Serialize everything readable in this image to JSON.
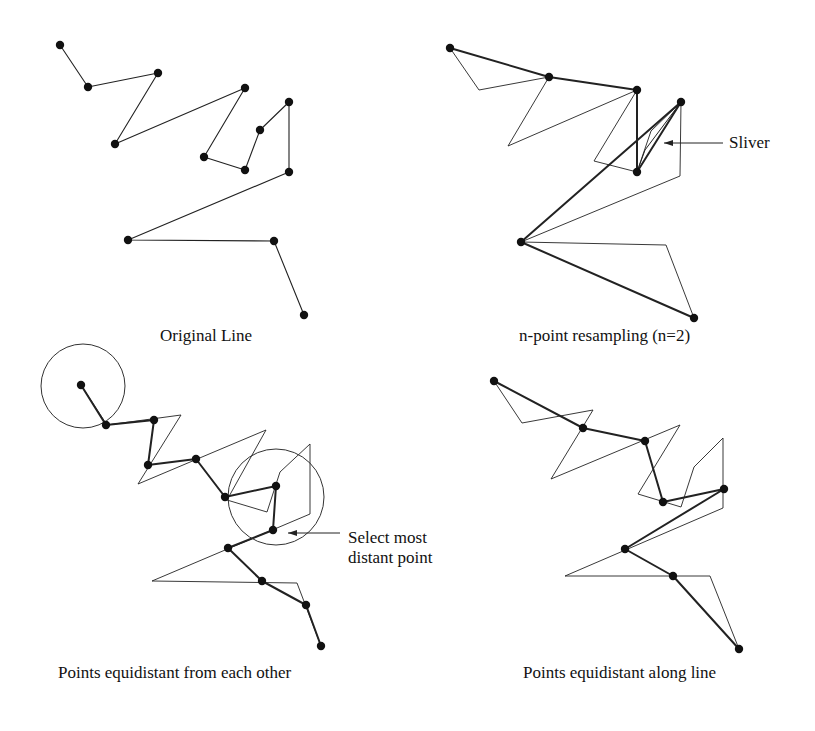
{
  "panels": [
    {
      "id": "original",
      "caption": "Original Line",
      "original_line": [
        [
          60,
          45
        ],
        [
          88,
          87
        ],
        [
          158,
          73
        ],
        [
          115,
          144
        ],
        [
          245,
          88
        ],
        [
          204,
          157
        ],
        [
          245,
          170
        ],
        [
          260,
          130
        ],
        [
          289,
          102
        ],
        [
          289,
          172
        ],
        [
          128,
          240
        ],
        [
          274,
          241
        ],
        [
          304,
          315
        ]
      ],
      "points": [
        [
          60,
          45
        ],
        [
          88,
          87
        ],
        [
          158,
          73
        ],
        [
          115,
          144
        ],
        [
          245,
          88
        ],
        [
          204,
          157
        ],
        [
          245,
          170
        ],
        [
          260,
          130
        ],
        [
          289,
          102
        ],
        [
          289,
          172
        ],
        [
          128,
          240
        ],
        [
          274,
          241
        ],
        [
          304,
          315
        ]
      ],
      "resampled_line": []
    },
    {
      "id": "n-point",
      "caption": "n-point resampling (n=2)",
      "annotation": "Sliver",
      "original_line": [
        [
          450,
          48
        ],
        [
          479,
          90
        ],
        [
          549,
          77
        ],
        [
          508,
          146
        ],
        [
          637,
          90
        ],
        [
          594,
          161
        ],
        [
          637,
          172
        ],
        [
          651,
          131
        ],
        [
          681,
          102
        ],
        [
          680,
          176
        ],
        [
          521,
          242
        ],
        [
          666,
          245
        ],
        [
          694,
          318
        ]
      ],
      "resampled_line": [
        [
          450,
          48
        ],
        [
          549,
          77
        ],
        [
          637,
          90
        ],
        [
          637,
          172
        ],
        [
          681,
          102
        ],
        [
          521,
          242
        ],
        [
          694,
          318
        ]
      ],
      "sliver_line": [
        [
          637,
          172
        ],
        [
          645,
          150
        ],
        [
          681,
          102
        ]
      ],
      "points": [
        [
          450,
          48
        ],
        [
          549,
          77
        ],
        [
          637,
          90
        ],
        [
          681,
          102
        ],
        [
          637,
          172
        ],
        [
          521,
          242
        ],
        [
          694,
          318
        ]
      ]
    },
    {
      "id": "equidistant-each-other",
      "caption": "Points equidistant from each other",
      "annotation": [
        "Select most",
        "distant point"
      ],
      "original_line": [
        [
          81,
          385
        ],
        [
          107,
          425
        ],
        [
          181,
          415
        ],
        [
          138,
          484
        ],
        [
          266,
          430
        ],
        [
          227,
          500
        ],
        [
          267,
          512
        ],
        [
          280,
          472
        ],
        [
          310,
          444
        ],
        [
          310,
          514
        ],
        [
          152,
          581
        ],
        [
          297,
          583
        ],
        [
          321,
          646
        ]
      ],
      "resampled_line": [
        [
          81,
          385
        ],
        [
          106,
          425
        ],
        [
          154,
          420
        ],
        [
          148,
          465
        ],
        [
          196,
          459
        ],
        [
          225,
          497
        ],
        [
          276,
          486
        ],
        [
          273,
          530
        ],
        [
          228,
          548
        ],
        [
          262,
          581
        ],
        [
          306,
          605
        ],
        [
          321,
          646
        ]
      ],
      "points": [
        [
          81,
          385
        ],
        [
          106,
          425
        ],
        [
          154,
          420
        ],
        [
          148,
          465
        ],
        [
          196,
          459
        ],
        [
          225,
          497
        ],
        [
          276,
          486
        ],
        [
          273,
          530
        ],
        [
          228,
          548
        ],
        [
          262,
          581
        ],
        [
          306,
          605
        ],
        [
          321,
          646
        ]
      ],
      "circles": [
        {
          "cx": 83,
          "cy": 386,
          "r": 42
        },
        {
          "cx": 276,
          "cy": 497,
          "r": 48
        }
      ]
    },
    {
      "id": "equidistant-along-line",
      "caption": "Points equidistant along line",
      "original_line": [
        [
          494,
          381
        ],
        [
          522,
          423
        ],
        [
          593,
          410
        ],
        [
          551,
          479
        ],
        [
          680,
          425
        ],
        [
          638,
          494
        ],
        [
          681,
          507
        ],
        [
          694,
          467
        ],
        [
          723,
          438
        ],
        [
          723,
          508
        ],
        [
          565,
          576
        ],
        [
          710,
          576
        ],
        [
          739,
          649
        ]
      ],
      "resampled_line": [
        [
          494,
          381
        ],
        [
          583,
          428
        ],
        [
          645,
          441
        ],
        [
          663,
          502
        ],
        [
          724,
          489
        ],
        [
          625,
          549
        ],
        [
          673,
          576
        ],
        [
          739,
          649
        ]
      ],
      "points": [
        [
          494,
          381
        ],
        [
          583,
          428
        ],
        [
          645,
          441
        ],
        [
          663,
          502
        ],
        [
          724,
          489
        ],
        [
          625,
          549
        ],
        [
          673,
          576
        ],
        [
          739,
          649
        ]
      ]
    }
  ]
}
